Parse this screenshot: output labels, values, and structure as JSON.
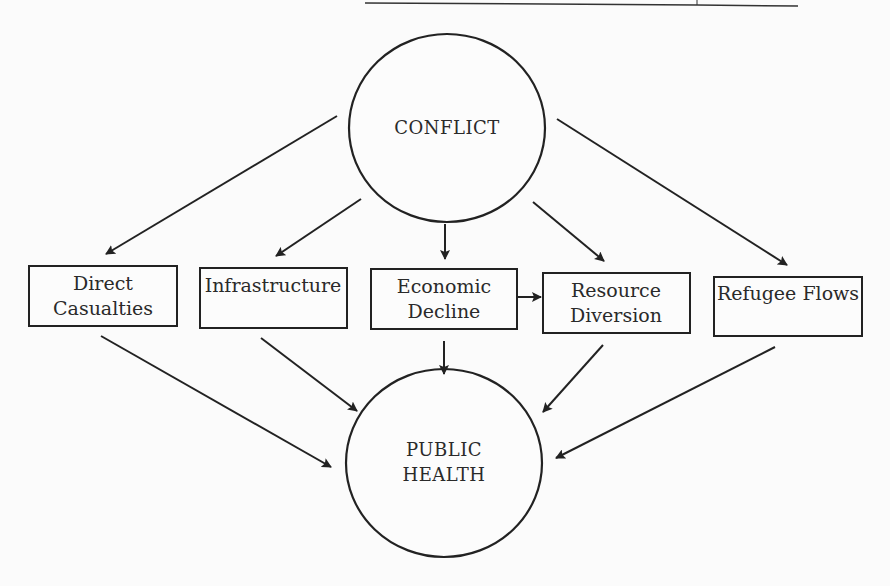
{
  "diagram": {
    "nodes": {
      "conflict": {
        "label": "CONFLICT"
      },
      "public_health": {
        "line1": "PUBLIC",
        "line2": "HEALTH"
      },
      "direct_casualties": {
        "line1": "Direct",
        "line2": "Casualties"
      },
      "infrastructure": {
        "line1": "Infrastructure"
      },
      "economic_decline": {
        "line1": "Economic",
        "line2": "Decline"
      },
      "resource_diversion": {
        "line1": "Resource",
        "line2": "Diversion"
      },
      "refugee_flows": {
        "line1": "Refugee Flows"
      }
    },
    "edges": [
      {
        "from": "CONFLICT",
        "to": "Direct Casualties"
      },
      {
        "from": "CONFLICT",
        "to": "Infrastructure"
      },
      {
        "from": "CONFLICT",
        "to": "Economic Decline"
      },
      {
        "from": "CONFLICT",
        "to": "Resource Diversion"
      },
      {
        "from": "CONFLICT",
        "to": "Refugee Flows"
      },
      {
        "from": "Economic Decline",
        "to": "Resource Diversion"
      },
      {
        "from": "Direct Casualties",
        "to": "PUBLIC HEALTH"
      },
      {
        "from": "Infrastructure",
        "to": "PUBLIC HEALTH"
      },
      {
        "from": "Economic Decline",
        "to": "PUBLIC HEALTH"
      },
      {
        "from": "Resource Diversion",
        "to": "PUBLIC HEALTH"
      },
      {
        "from": "Refugee Flows",
        "to": "PUBLIC HEALTH"
      }
    ]
  }
}
